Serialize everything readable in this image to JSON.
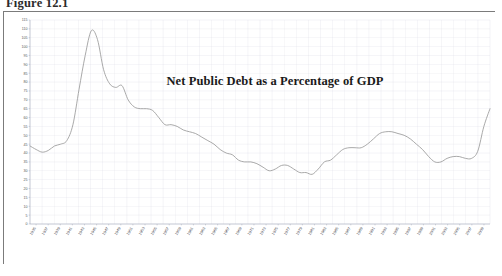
{
  "document": {
    "figure_label": "Figure 12.1"
  },
  "chart_frame": {
    "border_color": "#7b7b7b",
    "background": "#fdfdfd"
  },
  "chart_data": {
    "type": "line",
    "title": "Net Public Debt as a Percentage of GDP",
    "xlabel": "",
    "ylabel": "",
    "grid": true,
    "legend": "none",
    "line_color": "#9a9a9a",
    "plot_background": "#ffffff",
    "gridline_color": "#d8d8e4",
    "axis_color": "#9aa0b0",
    "ylim": [
      0,
      115
    ],
    "yticks": [
      0,
      5,
      10,
      15,
      20,
      25,
      30,
      35,
      40,
      45,
      50,
      55,
      60,
      65,
      70,
      75,
      80,
      85,
      90,
      95,
      100,
      105,
      110,
      115
    ],
    "ytick_labels": [
      "0",
      "5",
      "10",
      "15",
      "20",
      "25",
      "30",
      "35",
      "40",
      "45",
      "50",
      "55",
      "60",
      "65",
      "70",
      "75",
      "80",
      "85",
      "90",
      "95",
      "100",
      "105",
      "110",
      "115"
    ],
    "xlim": [
      1935,
      2010
    ],
    "xtick_labels": [
      "1935",
      "1937",
      "1939",
      "1941",
      "1943",
      "1945",
      "1947",
      "1949",
      "1951",
      "1953",
      "1955",
      "1957",
      "1959",
      "1961",
      "1963",
      "1965",
      "1967",
      "1969",
      "1971",
      "1973",
      "1975",
      "1977",
      "1979",
      "1981",
      "1983",
      "1985",
      "1987",
      "1989",
      "1991",
      "1993",
      "1995",
      "1997",
      "1999",
      "2001",
      "2003",
      "2005",
      "2007",
      "2009"
    ],
    "x": [
      1935,
      1936,
      1937,
      1938,
      1939,
      1940,
      1941,
      1942,
      1943,
      1944,
      1945,
      1946,
      1947,
      1948,
      1949,
      1950,
      1951,
      1952,
      1953,
      1954,
      1955,
      1956,
      1957,
      1958,
      1959,
      1960,
      1961,
      1962,
      1963,
      1964,
      1965,
      1966,
      1967,
      1968,
      1969,
      1970,
      1971,
      1972,
      1973,
      1974,
      1975,
      1976,
      1977,
      1978,
      1979,
      1980,
      1981,
      1982,
      1983,
      1984,
      1985,
      1986,
      1987,
      1988,
      1989,
      1990,
      1991,
      1992,
      1993,
      1994,
      1995,
      1996,
      1997,
      1998,
      1999,
      2000,
      2001,
      2002,
      2003,
      2004,
      2005,
      2006,
      2007,
      2008,
      2009,
      2010
    ],
    "values": [
      44,
      42,
      40.5,
      41.5,
      44,
      45,
      47,
      56,
      76,
      95,
      109,
      104,
      87,
      79,
      77,
      78,
      70,
      66,
      65,
      65,
      64,
      60,
      56,
      56,
      55,
      53,
      52,
      51,
      49,
      47,
      45,
      42,
      40,
      39,
      36,
      35,
      35,
      34,
      32,
      30,
      31,
      33,
      33,
      31,
      29,
      29,
      28,
      31,
      35,
      36,
      39,
      42,
      43,
      43,
      43,
      45,
      48,
      51,
      52,
      52,
      51,
      50,
      48,
      45,
      42,
      38,
      35,
      35,
      37,
      38,
      38,
      37,
      37,
      41,
      55,
      65
    ]
  }
}
